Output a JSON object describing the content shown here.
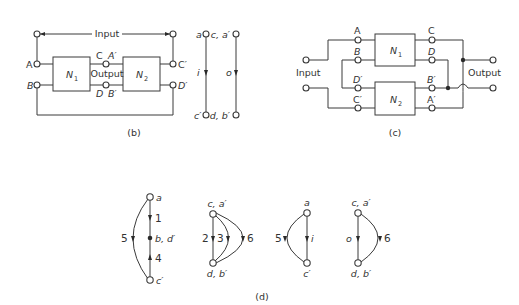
{
  "figure_b": {
    "caption": "(b)",
    "input_label": "Input",
    "output_label": "Output",
    "block1": "N",
    "block1_sub": "1",
    "block2": "N",
    "block2_sub": "2",
    "terminals": {
      "A": "A",
      "B": "B",
      "C": "C",
      "A_prime": "A′",
      "D": "D",
      "B_prime": "B′",
      "C_prime": "C′",
      "D_prime": "D′"
    }
  },
  "figure_b_graph": {
    "left_edge": {
      "top": "a",
      "bottom": "c′",
      "label": "i"
    },
    "right_edge": {
      "top": "c, a′",
      "bottom": "d, b′",
      "label": "o"
    }
  },
  "figure_c": {
    "caption": "(c)",
    "input_label": "Input",
    "output_label": "Output",
    "block1": "N",
    "block1_sub": "1",
    "block2": "N",
    "block2_sub": "2",
    "terminals": {
      "A": "A",
      "B": "B",
      "D_prime": "D′",
      "C_prime": "C′",
      "C": "C",
      "D": "D",
      "B_prime": "B′",
      "A_prime": "A′"
    }
  },
  "figure_d": {
    "caption": "(d)",
    "graphs": [
      {
        "nodes": {
          "top": "a",
          "middle": "b, d′",
          "bottom": "c′"
        },
        "edges": [
          "1",
          "4",
          "5"
        ]
      },
      {
        "nodes": {
          "top": "c, a′",
          "bottom": "d, b′"
        },
        "edges": [
          "2",
          "3",
          "6"
        ]
      },
      {
        "nodes": {
          "top": "a",
          "bottom": "c′"
        },
        "edges": [
          "5",
          "i"
        ]
      },
      {
        "nodes": {
          "top": "c, a′",
          "bottom": "d, b′"
        },
        "edges": [
          "o",
          "6"
        ]
      }
    ]
  }
}
